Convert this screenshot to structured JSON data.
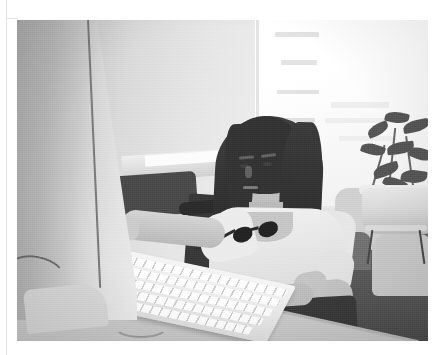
{
  "page": {
    "background_color": "#ffffff",
    "width": 445,
    "height": 355
  },
  "photo": {
    "x": 17,
    "y": 20,
    "width": 411,
    "height": 321,
    "color_mode": "grayscale",
    "description": "A young woman with long dark hair sits at a light gray office desk, her left arm extended toward an aluminum keyboard while she looks at a computer monitor seen edge-on at the left of the frame. A bright, overexposed window fills the upper right behind her, with a leafy potted plant on a small stand. Light upholstered lounge chairs and dark carpet occupy the right background.",
    "subject": {
      "name": "seated-woman",
      "hair": "long straight dark brown hair",
      "top": "light cream short-sleeve t-shirt",
      "bottom": "dark shorts",
      "accessory": "sunglasses hooked on shirt collar",
      "pose": "seated, right hand in lap, left arm reaching to keyboard, gaze toward monitor"
    },
    "objects": [
      {
        "name": "computer-monitor",
        "detail": "light gray flat panel viewed edge-on, foreground left"
      },
      {
        "name": "aluminum-keyboard",
        "detail": "low-profile silver keyboard with white keys on desk"
      },
      {
        "name": "office-desk",
        "detail": "light gray laminate desktop angling across the lower frame"
      },
      {
        "name": "office-chair",
        "detail": "dark task chair with arms behind the subject"
      },
      {
        "name": "potted-plant",
        "detail": "broad-leaf plant in a pale ceramic pot, right background"
      },
      {
        "name": "plant-stand",
        "detail": "small round metal stool beneath the plant"
      },
      {
        "name": "lounge-chairs",
        "detail": "pale upholstered seating in the right background"
      },
      {
        "name": "window",
        "detail": "tall bright window, blown-out daylight with faint building outlines"
      },
      {
        "name": "partition-wall",
        "detail": "light office partition panel with vertical seam, left background"
      },
      {
        "name": "credenza",
        "detail": "low cabinet with white papers, middle-left background"
      },
      {
        "name": "carpet",
        "detail": "dark gray office carpet"
      }
    ],
    "tones": {
      "highlight": "#ffffff",
      "light_gray": "#e4e4e4",
      "mid_gray": "#b5b5b5",
      "dark_gray": "#4e4e4e",
      "shadow": "#262626"
    }
  },
  "page_marks": {
    "left_rule": "thin vertical scan rule near the left edge",
    "rule_color": "#e2e2e2"
  }
}
